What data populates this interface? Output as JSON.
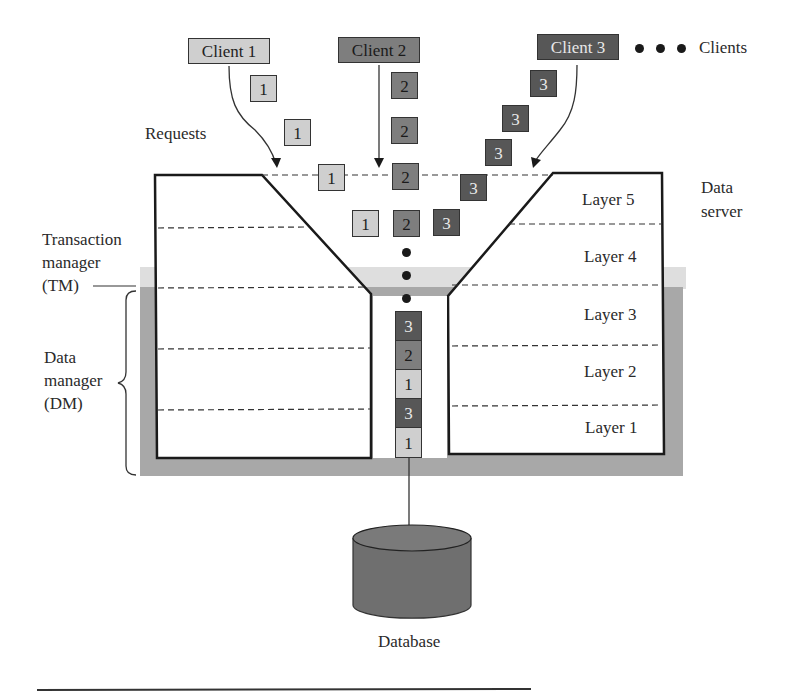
{
  "diagram": {
    "colors": {
      "client1": "#cfcfcf",
      "client2": "#7e7e7e",
      "client3": "#575757",
      "tm_band": "#dedede",
      "dm_band": "#a8a8a8",
      "database": "#6f6f6f",
      "outline": "#1a1a1a"
    },
    "clients": [
      {
        "label": "Client 1",
        "id": "1"
      },
      {
        "label": "Client 2",
        "id": "2"
      },
      {
        "label": "Client 3",
        "id": "3"
      }
    ],
    "clients_label": "Clients",
    "requests_label": "Requests",
    "data_server_label": [
      "Data",
      "server"
    ],
    "tm_label": [
      "Transaction",
      "manager",
      "(TM)"
    ],
    "dm_label": [
      "Data",
      "manager",
      "(DM)"
    ],
    "layers": [
      "Layer 5",
      "Layer 4",
      "Layer 3",
      "Layer 2",
      "Layer 1"
    ],
    "request_blocks": {
      "client1": [
        "1",
        "1",
        "1",
        "1"
      ],
      "client2": [
        "2",
        "2",
        "2",
        "2"
      ],
      "client3": [
        "3",
        "3",
        "3",
        "3",
        "3"
      ]
    },
    "queue": [
      "3",
      "2",
      "1",
      "3",
      "1"
    ],
    "database_label": "Database"
  }
}
